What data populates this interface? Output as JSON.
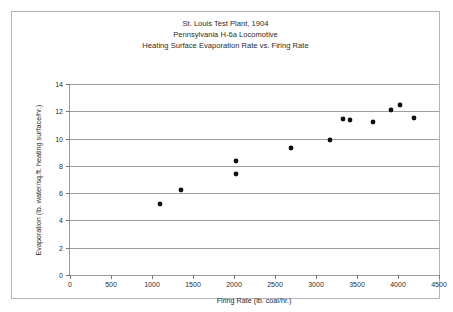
{
  "chart_data": {
    "type": "scatter",
    "title": "St. Louis Test Plant, 1904\nPennsylvania H-6a Locomotive\nHeating Surface Evaporation Rate vs. Firing Rate",
    "title_lines": [
      "St. Louis Test Plant, 1904",
      "Pennsylvania H-6a Locomotive",
      "Heating Surface Evaporation Rate vs. Firing Rate"
    ],
    "xlabel": "Firing Rate (lb. coal/hr.)",
    "ylabel": "Evaporation (lb. water/sq.ft. heating surface/hr.)",
    "xlim": [
      0,
      4500
    ],
    "ylim": [
      0,
      14
    ],
    "xticks": [
      0,
      500,
      1000,
      1500,
      2000,
      2500,
      3000,
      3500,
      4000,
      4500
    ],
    "yticks": [
      0,
      2,
      4,
      6,
      8,
      10,
      12,
      14
    ],
    "xtick_labels": [
      "0",
      "500",
      "1000",
      "1500",
      "2000",
      "2500",
      "3000",
      "3500",
      "4000",
      "4500"
    ],
    "ytick_labels": [
      "0",
      "2",
      "4",
      "6",
      "8",
      "10",
      "12",
      "14"
    ],
    "grid": "horizontal",
    "legend": null,
    "marker_color": "#111111",
    "gridline_color": "#9f9f9f",
    "axis_color": "#9a9a9a",
    "points": [
      {
        "x": 1100,
        "y": 5.2
      },
      {
        "x": 1350,
        "y": 6.2
      },
      {
        "x": 2030,
        "y": 8.35
      },
      {
        "x": 2030,
        "y": 7.4
      },
      {
        "x": 2700,
        "y": 9.3
      },
      {
        "x": 3170,
        "y": 9.9
      },
      {
        "x": 3330,
        "y": 11.45
      },
      {
        "x": 3420,
        "y": 11.35
      },
      {
        "x": 3700,
        "y": 11.2
      },
      {
        "x": 3910,
        "y": 12.1
      },
      {
        "x": 4030,
        "y": 12.45
      },
      {
        "x": 4190,
        "y": 11.5
      }
    ]
  }
}
